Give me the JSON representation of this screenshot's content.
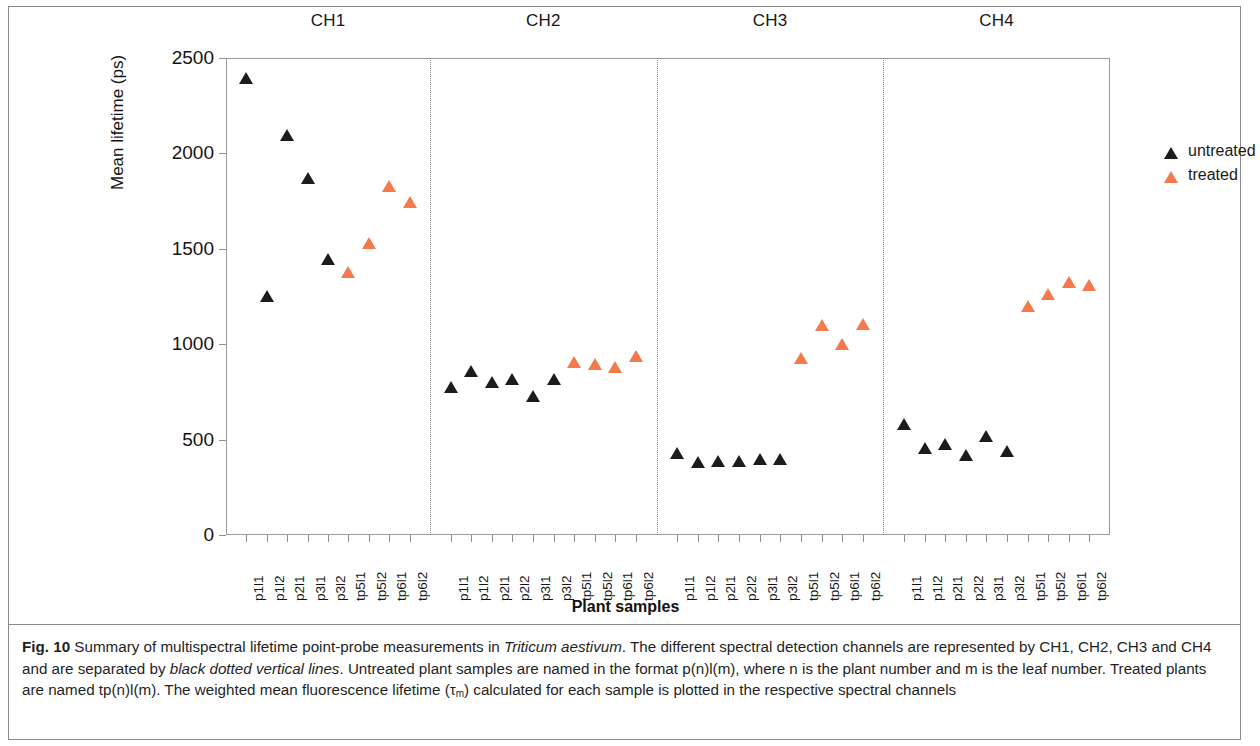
{
  "figure": {
    "label": "Fig. 10",
    "caption_part1": "Summary of multispectral lifetime point-probe measurements in ",
    "caption_species": "Triticum aestivum",
    "caption_part2": ". The different spectral detection channels are represented by CH1, CH2, CH3 and CH4 and are separated by ",
    "caption_italic2": "black dotted vertical lines",
    "caption_part3": ". Untreated plant samples are named in the format p(n)l(m), where n is the plant number and m is the leaf number. Treated plants are named tp(n)l(m). The weighted mean fluorescence lifetime (",
    "caption_tau": "τ",
    "caption_tau_sub": "m",
    "caption_part4": ") calculated for each sample is plotted in the respective spectral channels"
  },
  "colors": {
    "untreated": "#1C1C1C",
    "treated": "#F4794D",
    "axis": "#8D8D8D",
    "separator": "#8D8D8D"
  },
  "legend": {
    "position": "top-right",
    "entries": [
      {
        "label": "untreated",
        "color": "#1C1C1C",
        "marker": "triangle-up"
      },
      {
        "label": "treated",
        "color": "#F4794D",
        "marker": "triangle-up"
      }
    ]
  },
  "chart_data": {
    "type": "scatter",
    "title": "",
    "xlabel": "Plant samples",
    "ylabel": "Mean lifetime (ps)",
    "ylim": [
      0,
      2500
    ],
    "yticks": [
      0,
      500,
      1000,
      1500,
      2000,
      2500
    ],
    "grid": false,
    "channel_headers": [
      "CH1",
      "CH2",
      "CH3",
      "CH4"
    ],
    "panels": [
      {
        "channel": "CH1",
        "categories": [
          "p1l1",
          "p1l2",
          "p2l1",
          "p3l1",
          "p3l2",
          "tp5l1",
          "tp5l2",
          "tp6l1",
          "tp6l2"
        ],
        "groups": [
          "untreated",
          "untreated",
          "untreated",
          "untreated",
          "untreated",
          "treated",
          "treated",
          "treated",
          "treated"
        ],
        "values": [
          2380,
          1235,
          2080,
          1855,
          1430,
          1365,
          1515,
          1815,
          1730
        ]
      },
      {
        "channel": "CH2",
        "categories": [
          "p1l1",
          "p1l2",
          "p2l1",
          "p2l2",
          "p3l1",
          "p3l2",
          "tp5l1",
          "tp5l2",
          "tp6l1",
          "tp6l2"
        ],
        "groups": [
          "untreated",
          "untreated",
          "untreated",
          "untreated",
          "untreated",
          "untreated",
          "treated",
          "treated",
          "treated",
          "treated"
        ],
        "values": [
          760,
          845,
          785,
          800,
          715,
          800,
          890,
          880,
          865,
          920
        ]
      },
      {
        "channel": "CH3",
        "categories": [
          "p1l1",
          "p1l2",
          "p2l1",
          "p2l2",
          "p3l1",
          "p3l2",
          "tp5l1",
          "tp5l2",
          "tp6l1",
          "tp6l2"
        ],
        "groups": [
          "untreated",
          "untreated",
          "untreated",
          "untreated",
          "untreated",
          "untreated",
          "treated",
          "treated",
          "treated",
          "treated"
        ],
        "values": [
          415,
          365,
          370,
          370,
          385,
          380,
          910,
          1085,
          985,
          1090
        ]
      },
      {
        "channel": "CH4",
        "categories": [
          "p1l1",
          "p1l2",
          "p2l1",
          "p2l2",
          "p3l1",
          "p3l2",
          "tp5l1",
          "tp5l2",
          "tp6l1",
          "tp6l2"
        ],
        "groups": [
          "untreated",
          "untreated",
          "untreated",
          "untreated",
          "untreated",
          "untreated",
          "treated",
          "treated",
          "treated",
          "treated"
        ],
        "values": [
          565,
          440,
          460,
          405,
          505,
          425,
          1185,
          1250,
          1310,
          1295
        ]
      }
    ]
  }
}
